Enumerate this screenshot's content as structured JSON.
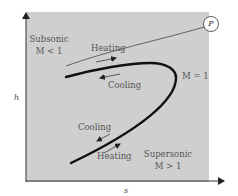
{
  "diagram": {
    "axes": {
      "y_label": "h",
      "x_label": "s"
    },
    "regions": {
      "subsonic": {
        "title": "Subsonic",
        "condition": "M < 1"
      },
      "supersonic": {
        "title": "Supersonic",
        "condition": "M > 1"
      }
    },
    "point": {
      "label": "P"
    },
    "nose_label": "M = 1",
    "upper_branch": {
      "heating": "Heating",
      "cooling": "Cooling"
    },
    "lower_branch": {
      "cooling": "Cooling",
      "heating": "Heating"
    },
    "colors": {
      "plot_bg": "#cfcfcf",
      "curve": "#111111",
      "text": "#555555"
    }
  }
}
